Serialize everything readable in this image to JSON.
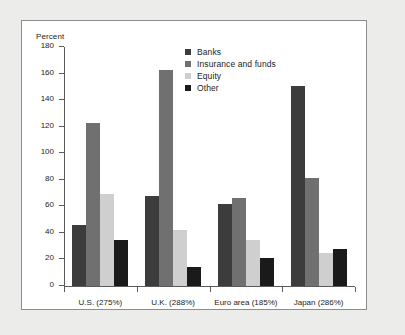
{
  "chart_data": {
    "type": "bar",
    "title": "",
    "xlabel": "",
    "ylabel": "Percent",
    "ylim": [
      0,
      180
    ],
    "yticks": [
      0,
      20,
      40,
      60,
      80,
      100,
      120,
      140,
      160,
      180
    ],
    "grid": false,
    "legend_position": "top-center",
    "categories": [
      "U.S. (275%)",
      "U.K. (288%)",
      "Euro area (185%)",
      "Japan (286%)"
    ],
    "series": [
      {
        "name": "Banks",
        "color": "#3c3c3c",
        "values": [
          46,
          68,
          62,
          151
        ]
      },
      {
        "name": "Insurance and funds",
        "color": "#707070",
        "values": [
          123,
          163,
          66,
          81
        ]
      },
      {
        "name": "Equity",
        "color": "#cfcfcf",
        "values": [
          69,
          42,
          35,
          25
        ]
      },
      {
        "name": "Other",
        "color": "#1a1a1a",
        "values": [
          35,
          14,
          21,
          28
        ]
      }
    ]
  },
  "colors": {
    "page_background": "#ececeb",
    "panel_background": "#ffffff",
    "panel_border": "#8d8d8d",
    "axis": "#5b5b5b",
    "text": "#1c1c1c"
  }
}
